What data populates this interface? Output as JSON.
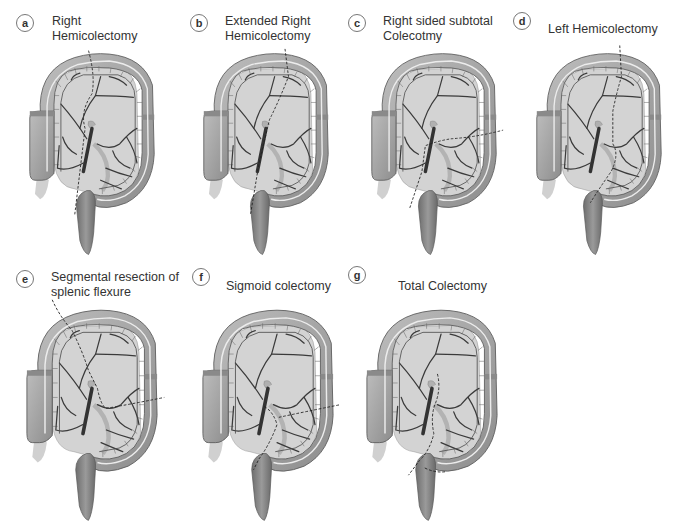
{
  "figure": {
    "panels": [
      {
        "letter": "a",
        "title_lines": [
          "Right",
          "Hemicolectomy"
        ],
        "cut": "right"
      },
      {
        "letter": "b",
        "title_lines": [
          "Extended Right",
          "Hemicolectomy"
        ],
        "cut": "extended-right"
      },
      {
        "letter": "c",
        "title_lines": [
          "Right sided subtotal",
          "Colecotmy"
        ],
        "cut": "right-subtotal"
      },
      {
        "letter": "d",
        "title_lines": [
          "Left Hemicolectomy"
        ],
        "cut": "left"
      },
      {
        "letter": "e",
        "title_lines": [
          "Segmental resection of",
          "splenic flexure"
        ],
        "cut": "splenic"
      },
      {
        "letter": "f",
        "title_lines": [
          "Sigmoid colectomy"
        ],
        "cut": "sigmoid"
      },
      {
        "letter": "g",
        "title_lines": [
          "Total Colectomy"
        ],
        "cut": "total"
      }
    ],
    "colors": {
      "bowel_fill": "#a9a9a9",
      "bowel_dark": "#7a7a7a",
      "mesentery": "#cfcfcf",
      "vessel": "#3a3a3a",
      "rectum": "#8a8a8a",
      "cut_line": "#222222",
      "taenia": "#e6e6e6"
    }
  }
}
